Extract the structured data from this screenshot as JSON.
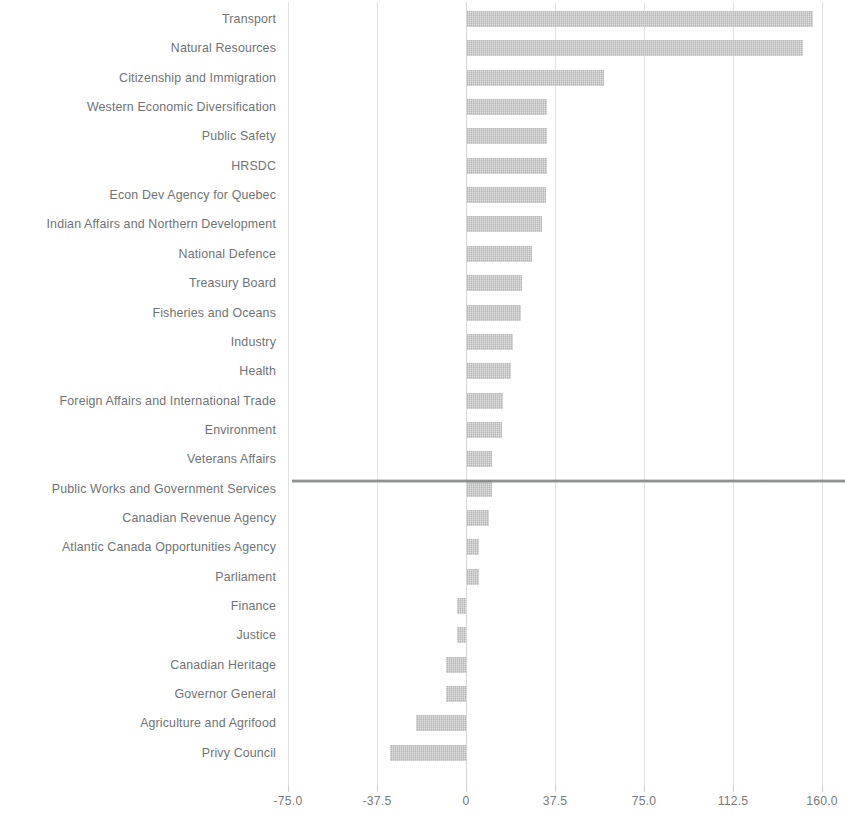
{
  "chart_data": {
    "type": "bar",
    "orientation": "horizontal",
    "title": "",
    "subtitle": "",
    "xlabel": "",
    "ylabel": "",
    "xlim": [
      -75.0,
      160.0
    ],
    "xticks": [
      "-75.0",
      "-37.5",
      "0",
      "37.5",
      "75.0",
      "112.5",
      "160.0"
    ],
    "xtick_values": [
      -75.0,
      -37.5,
      0,
      37.5,
      75.0,
      112.5,
      150.0
    ],
    "grid": true,
    "grid_axis": "x",
    "legend": "none",
    "bar_color": "#c2c2c2",
    "axis_color": "#6d7072",
    "label_color": "#6f7375",
    "categories": [
      "Transport",
      "Natural Resources",
      "Citizenship and Immigration",
      "Western Economic Diversification",
      "Public Safety",
      "HRSDC",
      "Econ Dev Agency for Quebec",
      "Indian Affairs and Northern Development",
      "National Defence",
      "Treasury Board",
      "Fisheries and Oceans",
      "Industry",
      "Health",
      "Foreign Affairs and International Trade",
      "Environment",
      "Veterans Affairs",
      "Public Works and Government Services",
      "Canadian Revenue Agency",
      "Atlantic Canada Opportunities Agency",
      "Parliament",
      "Finance",
      "Justice",
      "Canadian Heritage",
      "Governor General",
      "Agriculture and Agrifood",
      "Privy Council"
    ],
    "values": [
      146.0,
      142.0,
      58.0,
      34.0,
      34.0,
      34.0,
      33.5,
      32.0,
      28.0,
      23.5,
      23.0,
      20.0,
      19.0,
      15.5,
      15.0,
      11.0,
      11.0,
      9.5,
      5.5,
      5.5,
      -4.0,
      -4.0,
      -8.5,
      -8.5,
      -21.0,
      -32.0
    ]
  }
}
